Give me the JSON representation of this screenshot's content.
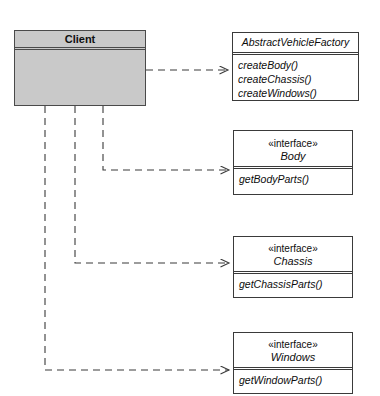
{
  "diagram": {
    "type": "uml-class-diagram",
    "background_color": "#ffffff",
    "line_color": "#3a3a3a",
    "client_fill_color": "#c9c9c9"
  },
  "client": {
    "name": "Client",
    "x": 14,
    "y": 30,
    "width": 132,
    "height": 76
  },
  "classes": [
    {
      "id": "abstract-vehicle-factory",
      "stereotype": "",
      "name": "AbstractVehicleFactory",
      "abstract": true,
      "operations": [
        "createBody()",
        "createChassis()",
        "createWindows()"
      ],
      "x": 232,
      "y": 32,
      "width": 127,
      "height": 69
    },
    {
      "id": "body",
      "stereotype": "«interface»",
      "name": "Body",
      "abstract": true,
      "operations": [
        "getBodyParts()"
      ],
      "x": 233,
      "y": 130,
      "width": 120,
      "height": 65
    },
    {
      "id": "chassis",
      "stereotype": "«interface»",
      "name": "Chassis",
      "abstract": true,
      "operations": [
        "getChassisParts()"
      ],
      "x": 233,
      "y": 236,
      "width": 120,
      "height": 62
    },
    {
      "id": "windows",
      "stereotype": "«interface»",
      "name": "Windows",
      "abstract": true,
      "operations": [
        "getWindowParts()"
      ],
      "x": 233,
      "y": 332,
      "width": 120,
      "height": 62
    }
  ],
  "relationships": [
    {
      "id": "client-to-factory",
      "type": "dependency",
      "style": "dashed-open-arrow",
      "from": "Client",
      "to": "AbstractVehicleFactory",
      "path": "M146,70 L231,70"
    },
    {
      "id": "client-to-body",
      "type": "dependency",
      "style": "dashed-open-arrow",
      "from": "Client",
      "to": "Body",
      "path": "M103,106 L103,170 L232,170"
    },
    {
      "id": "client-to-chassis",
      "type": "dependency",
      "style": "dashed-open-arrow",
      "from": "Client",
      "to": "Chassis",
      "path": "M75,106 L75,263 L232,263"
    },
    {
      "id": "client-to-windows",
      "type": "dependency",
      "style": "dashed-open-arrow",
      "from": "Client",
      "to": "Windows",
      "path": "M45,106 L45,370 L232,370"
    }
  ]
}
